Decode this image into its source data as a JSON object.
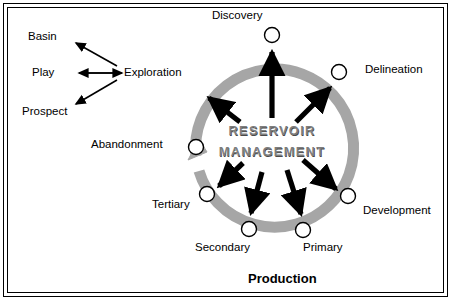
{
  "figure": {
    "center_line1": "RESERVOIR",
    "center_line2": "MANAGEMENT",
    "production_label": "Production",
    "ring_color": "#a6a6a6",
    "node_fill": "#ffffff",
    "stroke_color": "#000000"
  },
  "left_branch": {
    "hub": "Exploration",
    "items": [
      {
        "label": "Basin"
      },
      {
        "label": "Play"
      },
      {
        "label": "Prospect"
      }
    ]
  },
  "cycle": {
    "nodes": [
      {
        "label": "Discovery"
      },
      {
        "label": "Delineation"
      },
      {
        "label": "Development"
      },
      {
        "label": "Primary"
      },
      {
        "label": "Secondary"
      },
      {
        "label": "Tertiary"
      },
      {
        "label": "Abandonment"
      }
    ]
  }
}
